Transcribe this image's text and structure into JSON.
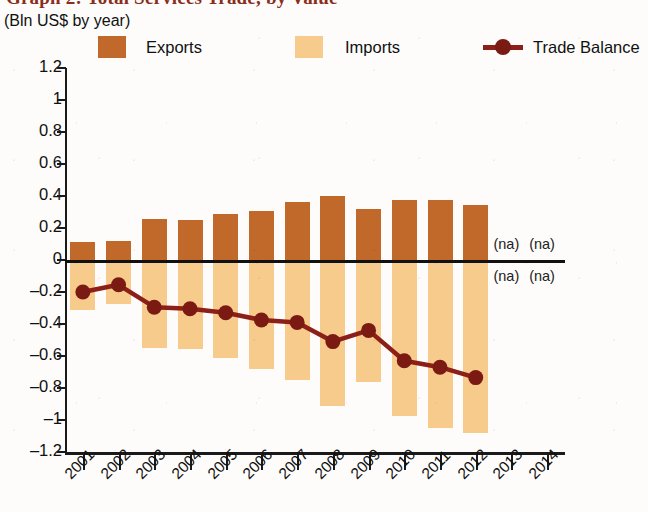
{
  "title": "Graph 2: Total Services Trade, by Value",
  "subtitle": "(Bln US$ by year)",
  "legend": {
    "exports": {
      "label": "Exports",
      "color": "#c0692a",
      "icon": "square-swatch-icon"
    },
    "imports": {
      "label": "Imports",
      "color": "#f6cb8c",
      "icon": "square-swatch-icon"
    },
    "balance": {
      "label": "Trade Balance",
      "color": "#8c2018",
      "icon": "line-marker-icon"
    }
  },
  "na_label": "(na)",
  "na_cells": [
    {
      "year": "2013",
      "position": "above-zero"
    },
    {
      "year": "2014",
      "position": "above-zero"
    },
    {
      "year": "2013",
      "position": "below-zero"
    },
    {
      "year": "2014",
      "position": "below-zero"
    }
  ],
  "chart_data": {
    "type": "bar",
    "title": "Graph 2: Total Services Trade, by Value",
    "subtitle": "(Bln US$ by year)",
    "xlabel": "",
    "ylabel": "Bln US$",
    "ylim": [
      -1.2,
      1.2
    ],
    "ytick_step": 0.2,
    "yticks": [
      "1.2",
      "1",
      "0.8",
      "0.6",
      "0.4",
      "0.2",
      "0",
      "–0.2",
      "–0.4",
      "–0.6",
      "–0.8",
      "–1",
      "–1.2"
    ],
    "grid": false,
    "legend_position": "top",
    "categories": [
      "2001",
      "2002",
      "2003",
      "2004",
      "2005",
      "2006",
      "2007",
      "2008",
      "2009",
      "2010",
      "2011",
      "2012",
      "2013",
      "2014"
    ],
    "series": [
      {
        "name": "Exports",
        "type": "bar",
        "color": "#c0692a",
        "values": [
          0.11,
          0.12,
          0.255,
          0.25,
          0.285,
          0.305,
          0.36,
          0.4,
          0.32,
          0.375,
          0.375,
          0.345,
          null,
          null
        ]
      },
      {
        "name": "Imports",
        "type": "bar",
        "color": "#f6cb8c",
        "values": [
          -0.31,
          -0.275,
          -0.55,
          -0.555,
          -0.615,
          -0.68,
          -0.75,
          -0.91,
          -0.76,
          -0.975,
          -1.05,
          -1.08,
          null,
          null
        ]
      },
      {
        "name": "Trade Balance",
        "type": "line",
        "color": "#8c2018",
        "values": [
          -0.2,
          -0.155,
          -0.295,
          -0.305,
          -0.33,
          -0.375,
          -0.39,
          -0.51,
          -0.44,
          -0.63,
          -0.67,
          -0.735,
          null,
          null
        ]
      }
    ]
  }
}
